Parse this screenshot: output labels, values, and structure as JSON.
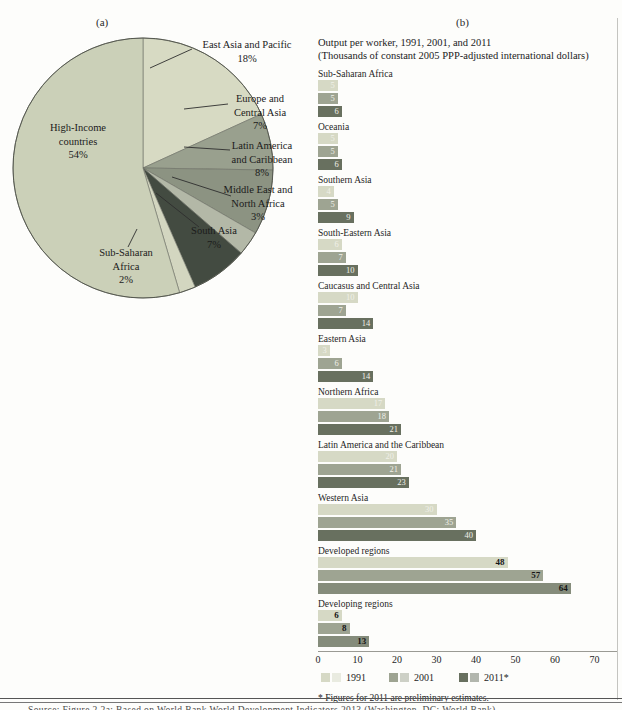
{
  "page": {
    "panel_a_label": "(a)",
    "panel_b_label": "(b)",
    "source_line": "Source: Figure 2.2a: Based on World Bank World Development Indicators 2013 (Washington, DC: World Bank)."
  },
  "chart_data": [
    {
      "type": "pie",
      "panel": "(a)",
      "start_angle": "top",
      "direction": "clockwise",
      "slices": [
        {
          "label": "East Asia and Pacific",
          "label_lines": [
            "East Asia and Pacific"
          ],
          "value": 18,
          "pct_label": "18%",
          "color": "#d7dac3"
        },
        {
          "label": "Europe and Central Asia",
          "label_lines": [
            "Europe and",
            "Central Asia"
          ],
          "value": 7,
          "pct_label": "7%",
          "color": "#99a08e"
        },
        {
          "label": "Latin America and Caribbean",
          "label_lines": [
            "Latin America",
            "and Caribbean"
          ],
          "value": 8,
          "pct_label": "8%",
          "color": "#8c9382"
        },
        {
          "label": "Middle East and North Africa",
          "label_lines": [
            "Middle East and",
            "North Africa"
          ],
          "value": 3,
          "pct_label": "3%",
          "color": "#b3b8a7"
        },
        {
          "label": "South Asia",
          "label_lines": [
            "South Asia"
          ],
          "value": 7,
          "pct_label": "7%",
          "color": "#434b41"
        },
        {
          "label": "Sub-Saharan Africa",
          "label_lines": [
            "Sub-Saharan",
            "Africa"
          ],
          "value": 2,
          "pct_label": "2%",
          "color": "#d3d6c0"
        },
        {
          "label": "High-Income countries",
          "label_lines": [
            "High-Income",
            "countries"
          ],
          "value": 54,
          "pct_label": "54%",
          "color": "#cbd0b8"
        }
      ]
    },
    {
      "type": "bar",
      "panel": "(b)",
      "title_line1": "Output per worker, 1991, 2001, and 2011",
      "title_line2": "(Thousands of constant 2005 PPP-adjusted international dollars)",
      "orientation": "horizontal",
      "xlim": [
        0,
        70
      ],
      "xticks": [
        0,
        10,
        20,
        30,
        40,
        50,
        60,
        70
      ],
      "series": [
        "1991",
        "2001",
        "2011*"
      ],
      "series_colors": [
        "#d6d9c5",
        "#9ea492",
        "#68705f"
      ],
      "alt_2011_color": "#858c7b",
      "categories": [
        {
          "label": "Sub-Saharan Africa",
          "values": [
            5,
            5,
            6
          ],
          "label_style": "light"
        },
        {
          "label": "Oceania",
          "values": [
            5,
            5,
            6
          ],
          "label_style": "light"
        },
        {
          "label": "Southern Asia",
          "values": [
            4,
            5,
            9
          ],
          "label_style": "light"
        },
        {
          "label": "South-Eastern Asia",
          "values": [
            6,
            7,
            10
          ],
          "label_style": "light"
        },
        {
          "label": "Caucasus and Central Asia",
          "values": [
            10,
            7,
            14
          ],
          "label_style": "light"
        },
        {
          "label": "Eastern Asia",
          "values": [
            3,
            6,
            14
          ],
          "label_style": "light"
        },
        {
          "label": "Northern Africa",
          "values": [
            17,
            18,
            21
          ],
          "label_style": "light"
        },
        {
          "label": "Latin America and the Caribbean",
          "values": [
            20,
            21,
            23
          ],
          "label_style": "light"
        },
        {
          "label": "Western Asia",
          "values": [
            30,
            35,
            40
          ],
          "label_style": "light"
        },
        {
          "label": "Developed regions",
          "values": [
            48,
            57,
            64
          ],
          "label_style": "dark"
        },
        {
          "label": "Developing regions",
          "values": [
            6,
            8,
            13
          ],
          "label_style": "dark"
        }
      ],
      "footnote": "* Figures for 2011 are preliminary estimates."
    }
  ]
}
